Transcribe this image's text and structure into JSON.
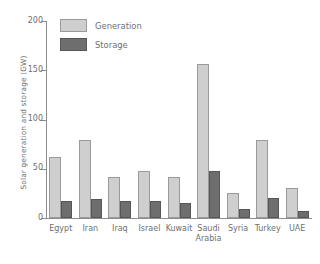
{
  "chart_data": {
    "type": "bar",
    "title": "",
    "xlabel": "",
    "ylabel": "Solar generation and storage (GW)",
    "ylim": [
      0,
      200
    ],
    "yticks": [
      0,
      50,
      100,
      150,
      200
    ],
    "grid": false,
    "legend_position": "top-left",
    "categories": [
      "Egypt",
      "Iran",
      "Iraq",
      "Israel",
      "Kuwait",
      "Saudi\nArabia",
      "Syria",
      "Turkey",
      "UAE"
    ],
    "series": [
      {
        "name": "Generation",
        "color": "#cfcfcf",
        "values": [
          62,
          79,
          42,
          48,
          42,
          156,
          25,
          79,
          30
        ]
      },
      {
        "name": "Storage",
        "color": "#6e6e6e",
        "values": [
          17,
          19,
          17,
          17,
          15,
          48,
          9,
          20,
          7
        ]
      }
    ]
  },
  "legend": {
    "items": [
      {
        "label": "Generation",
        "swatch": "generation"
      },
      {
        "label": "Storage",
        "swatch": "storage"
      }
    ]
  }
}
